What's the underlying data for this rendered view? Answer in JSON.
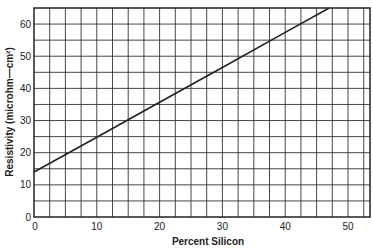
{
  "chart_data": {
    "type": "line",
    "title": "",
    "xlabel": "Percent Silicon",
    "ylabel": "Resistivity (microhm—cm²)",
    "xlim": [
      0,
      53.5
    ],
    "ylim": [
      0,
      65
    ],
    "x_ticks": [
      0,
      10,
      20,
      30,
      40,
      50
    ],
    "y_ticks": [
      0,
      10,
      20,
      30,
      40,
      50,
      60
    ],
    "x_grid_step": 2.5,
    "y_grid_step": 5,
    "grid": true,
    "legend": null,
    "series": [
      {
        "name": "Resistivity",
        "color": "#222222",
        "x": [
          0,
          10,
          20,
          30,
          40,
          47
        ],
        "y": [
          14,
          24.8,
          35.7,
          46.5,
          57.4,
          65
        ]
      }
    ]
  }
}
